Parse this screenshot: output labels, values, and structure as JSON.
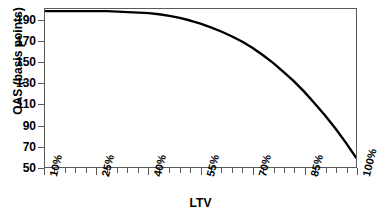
{
  "chart_data": {
    "type": "line",
    "title": "",
    "title_clipped": true,
    "xlabel": "LTV",
    "ylabel": "OAS (basis points)",
    "xlim": [
      10,
      100
    ],
    "ylim": [
      50,
      201
    ],
    "grid": false,
    "legend": null,
    "y_ticks": [
      190,
      170,
      150,
      130,
      110,
      90,
      70,
      50
    ],
    "y_tick_labels": [
      "190",
      "170",
      "150",
      "130",
      "110",
      "90",
      "70",
      "50"
    ],
    "x_ticks": [
      10,
      25,
      40,
      55,
      70,
      85,
      100
    ],
    "x_tick_labels": [
      "10%",
      "25%",
      "40%",
      "55%",
      "70%",
      "85%",
      "100%"
    ],
    "x_minor_tick_step": 3,
    "series": [
      {
        "name": "OAS vs LTV",
        "color": "#000000",
        "x": [
          10,
          13,
          16,
          19,
          22,
          25,
          28,
          31,
          34,
          37,
          40,
          43,
          46,
          49,
          52,
          55,
          58,
          61,
          64,
          67,
          70,
          73,
          76,
          79,
          82,
          85,
          88,
          91,
          94,
          97,
          100
        ],
        "values": [
          199,
          199,
          199,
          199,
          199,
          199,
          199,
          198.5,
          198,
          197.5,
          197,
          196,
          194.5,
          192.5,
          190,
          187,
          183.5,
          179.5,
          175,
          170,
          164,
          157,
          149.5,
          141,
          132,
          122,
          111,
          99.5,
          87,
          73.5,
          59
        ]
      }
    ]
  },
  "axes": {
    "y_title": "OAS (basis points)",
    "x_title": "LTV"
  }
}
